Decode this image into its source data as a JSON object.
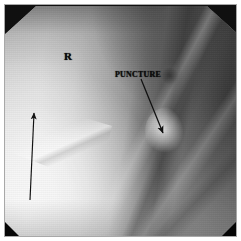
{
  "figure": {
    "kind": "fluoroscopic-radiograph",
    "modality": "Fluoroscopy / plain radiograph",
    "region": "Right groin (inguinal / common femoral region)",
    "border_color": "#a8a8a8",
    "background_color": "#ffffff",
    "mask_color": "#0b0b0b"
  },
  "annotations": {
    "laterality_marker": "R",
    "puncture_label": "PUNCTURE",
    "label_color": "#0d0d0d",
    "arrow_color": "#111111",
    "arrows": [
      {
        "name": "puncture-arrow",
        "points_to": "PUNCTURE",
        "direction": "down-right",
        "x1": 140,
        "y1": 78,
        "x2": 160,
        "y2": 130
      },
      {
        "name": "long-arrow",
        "points_to": "inguinal-fold",
        "direction": "up",
        "x1": 27,
        "y1": 197,
        "x2": 31,
        "y2": 110
      }
    ]
  }
}
